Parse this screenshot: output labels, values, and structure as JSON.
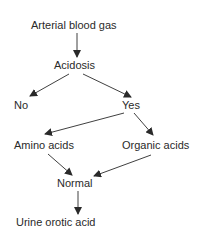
{
  "diagram": {
    "type": "flowchart",
    "nodes": {
      "arterial_blood_gas": "Arterial blood gas",
      "acidosis": "Acidosis",
      "no": "No",
      "yes": "Yes",
      "amino_acids": "Amino acids",
      "organic_acids": "Organic acids",
      "normal": "Normal",
      "urine_orotic_acid": "Urine orotic acid"
    },
    "edges": [
      {
        "from": "Arterial blood gas",
        "to": "Acidosis"
      },
      {
        "from": "Acidosis",
        "to": "No"
      },
      {
        "from": "Acidosis",
        "to": "Yes"
      },
      {
        "from": "Yes",
        "to": "Amino acids"
      },
      {
        "from": "Yes",
        "to": "Organic acids"
      },
      {
        "from": "Amino acids",
        "to": "Normal"
      },
      {
        "from": "Organic acids",
        "to": "Normal"
      },
      {
        "from": "Normal",
        "to": "Urine orotic acid"
      }
    ],
    "colors": {
      "text": "#2a2a2a",
      "arrow": "#2a2a2a",
      "background": "#ffffff"
    }
  }
}
